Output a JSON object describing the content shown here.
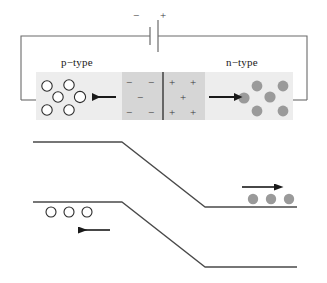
{
  "figure": {
    "background_color": "#ffffff",
    "line_color": "#4a4a4a",
    "dark_line_color": "#3a3a3a",
    "arrow_color": "#1a1a1a"
  },
  "circuit": {
    "battery": {
      "negative_label": "−",
      "positive_label": "+",
      "negative_plate_x": 150,
      "positive_plate_x": 158
    },
    "wire_color": "#6b6b6b"
  },
  "device": {
    "p_region": {
      "label": "p−type",
      "fill": "#ededed",
      "carrier_type": "holes",
      "carrier_fill": "#ffffff",
      "carrier_stroke": "#2b2b2b",
      "carrier_count": 7,
      "carriers": [
        {
          "cx": 47,
          "cy": 86,
          "r": 5.2
        },
        {
          "cx": 69,
          "cy": 85,
          "r": 5.2
        },
        {
          "cx": 58,
          "cy": 97,
          "r": 5.2
        },
        {
          "cx": 80,
          "cy": 97,
          "r": 5.6
        },
        {
          "cx": 47,
          "cy": 110,
          "r": 5.2
        },
        {
          "cx": 69,
          "cy": 110,
          "r": 5.2
        }
      ],
      "arrow": {
        "x1": 116,
        "y1": 97,
        "x2": 90,
        "y2": 97,
        "direction": "left"
      }
    },
    "depletion_negative": {
      "fill": "#d6d6d6",
      "sign": "−",
      "signs": [
        {
          "x": 130,
          "y": 83
        },
        {
          "x": 152,
          "y": 83
        },
        {
          "x": 141,
          "y": 98
        },
        {
          "x": 130,
          "y": 113
        },
        {
          "x": 152,
          "y": 113
        }
      ]
    },
    "depletion_positive": {
      "fill": "#d6d6d6",
      "sign": "+",
      "signs": [
        {
          "x": 172,
          "y": 83
        },
        {
          "x": 193,
          "y": 83
        },
        {
          "x": 183,
          "y": 98
        },
        {
          "x": 172,
          "y": 113
        },
        {
          "x": 193,
          "y": 113
        }
      ]
    },
    "junction_line_x": 163,
    "n_region": {
      "label": "n−type",
      "fill": "#ededed",
      "carrier_type": "electrons",
      "carrier_fill": "#9a9a9a",
      "carrier_count": 7,
      "carriers": [
        {
          "cx": 257,
          "cy": 86,
          "r": 5.4
        },
        {
          "cx": 283,
          "cy": 86,
          "r": 5.4
        },
        {
          "cx": 244,
          "cy": 98,
          "r": 5.6
        },
        {
          "cx": 270,
          "cy": 97,
          "r": 5.6
        },
        {
          "cx": 257,
          "cy": 111,
          "r": 5.4
        },
        {
          "cx": 283,
          "cy": 111,
          "r": 5.4
        }
      ],
      "arrow": {
        "x1": 209,
        "y1": 97,
        "x2": 236,
        "y2": 97,
        "direction": "right"
      }
    },
    "block": {
      "x": 36,
      "y": 72,
      "width": 257,
      "height": 48
    }
  },
  "band_diagram": {
    "conduction_band": {
      "left_y": 142,
      "right_y": 207,
      "bend_start_x": 122,
      "bend_end_x": 205,
      "left_x": 33,
      "right_x": 297
    },
    "valence_band": {
      "left_y": 202,
      "right_y": 267,
      "bend_start_x": 122,
      "bend_end_x": 205,
      "left_x": 33,
      "right_x": 297
    },
    "holes": {
      "fill": "#ffffff",
      "stroke": "#2b2b2b",
      "count": 3,
      "items": [
        {
          "cx": 51,
          "cy": 212,
          "r": 5.0
        },
        {
          "cx": 69,
          "cy": 212,
          "r": 5.0
        },
        {
          "cx": 87,
          "cy": 212,
          "r": 5.0
        }
      ],
      "arrow": {
        "x1": 110,
        "y1": 230,
        "x2": 75,
        "y2": 230,
        "direction": "left"
      }
    },
    "electrons": {
      "fill": "#9a9a9a",
      "count": 3,
      "items": [
        {
          "cx": 253,
          "cy": 199,
          "r": 5.2
        },
        {
          "cx": 271,
          "cy": 199,
          "r": 5.2
        },
        {
          "cx": 289,
          "cy": 199,
          "r": 5.2
        }
      ],
      "arrow": {
        "x1": 242,
        "y1": 187,
        "x2": 277,
        "y2": 187,
        "direction": "right"
      }
    }
  }
}
